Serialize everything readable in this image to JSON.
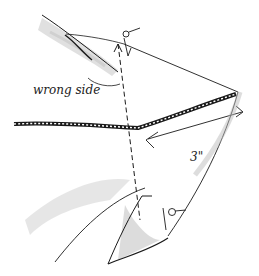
{
  "illustration": {
    "labels": {
      "wrong_side": "wrong side",
      "dimension": "3\""
    },
    "colors": {
      "ink": "#1a1a1a",
      "shade": "#b8b8b8"
    }
  }
}
